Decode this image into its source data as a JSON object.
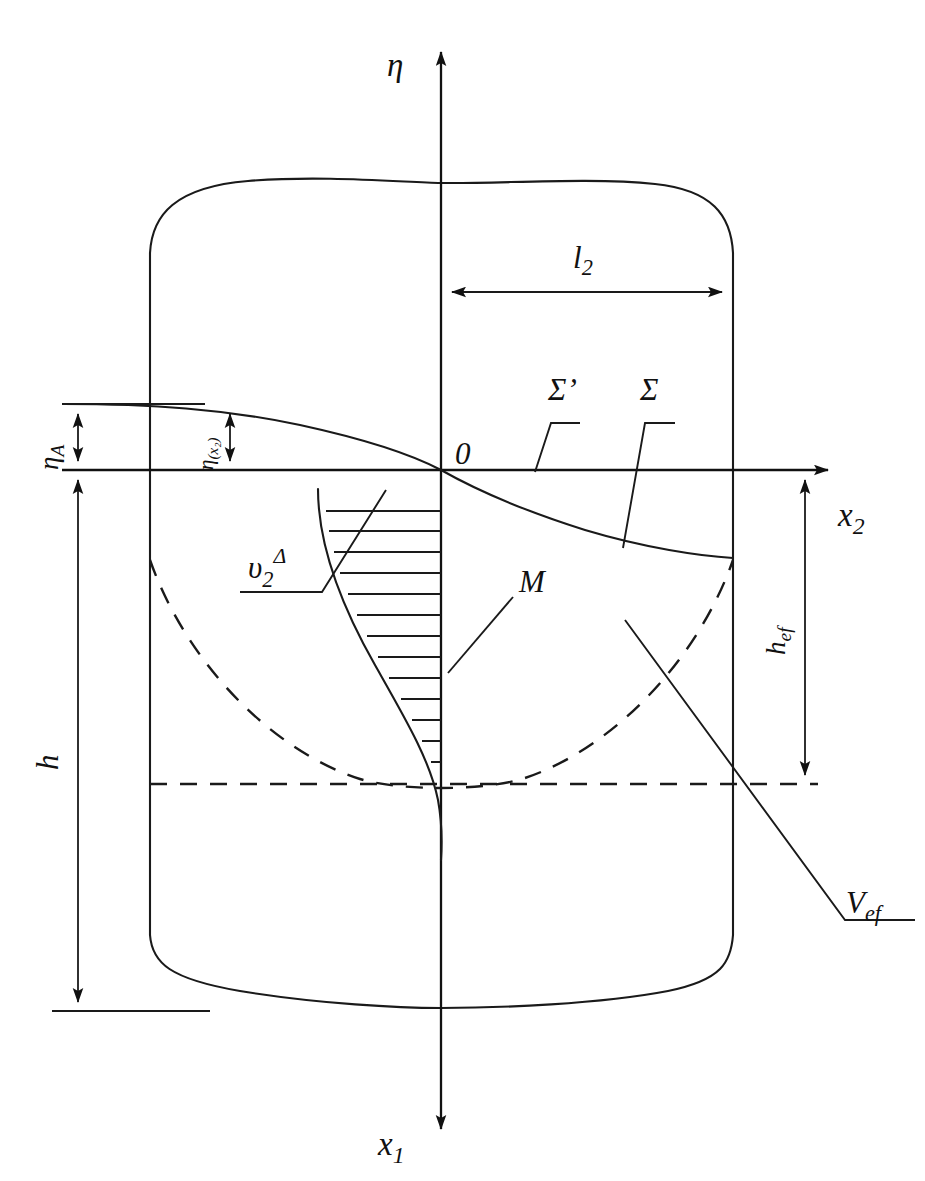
{
  "figure": {
    "kind": "engineering-diagram",
    "background_color": "#ffffff",
    "line_color": "#1a1a1a",
    "width": 925,
    "height": 1181
  },
  "axes": {
    "vertical_up": {
      "symbol": "η",
      "name": "eta-axis",
      "direction": "up",
      "label_side": "left"
    },
    "vertical_down": {
      "symbol": "x",
      "subscript": "1",
      "name": "x1-axis",
      "direction": "down",
      "label_side": "left"
    },
    "horizontal": {
      "symbol": "x",
      "subscript": "2",
      "name": "x2-axis",
      "direction": "right",
      "label_side": "right"
    },
    "origin": {
      "symbol": "0",
      "name": "origin-label"
    }
  },
  "dimensions": [
    {
      "id": "l2",
      "symbol": "l",
      "subscript": "2",
      "orientation": "horizontal",
      "double_headed": true,
      "description": "tank radius from axis to right wall"
    },
    {
      "id": "eta_A",
      "symbol": "η",
      "subscript": "A",
      "orientation": "vertical",
      "double_headed": true,
      "description": "free surface rise at wall above undisturbed level"
    },
    {
      "id": "eta_x2",
      "symbol": "η",
      "argument": "(x₂)",
      "orientation": "vertical",
      "double_headed": true,
      "description": "local free surface elevation function"
    },
    {
      "id": "h",
      "symbol": "h",
      "orientation": "vertical",
      "double_headed": true,
      "description": "total liquid depth"
    },
    {
      "id": "h_ef",
      "symbol": "h",
      "subscript": "ef",
      "orientation": "vertical",
      "double_headed": true,
      "description": "effective depth"
    }
  ],
  "annotations": [
    {
      "id": "sigma_prime",
      "symbol": "Σ",
      "prime": "’",
      "leader": "down-left to undisturbed free surface plane",
      "name": "sigma-prime-label"
    },
    {
      "id": "sigma",
      "symbol": "Σ",
      "leader": "down-left to deformed free surface curve",
      "name": "sigma-label"
    },
    {
      "id": "v2_delta",
      "symbol": "υ",
      "subscript": "2",
      "superscript": "Δ",
      "leader": "up-right to velocity profile boundary",
      "name": "v2-delta-label"
    },
    {
      "id": "M",
      "symbol": "M",
      "leader": "down-left to hatched velocity profile",
      "name": "m-label"
    },
    {
      "id": "V_ef",
      "symbol": "V",
      "subscript": "ef",
      "leader": "up-left into tank interior",
      "name": "v-ef-label"
    }
  ],
  "curves": [
    {
      "id": "free-surface",
      "style": "solid",
      "description": "S-shaped deformed free surface from left wall through origin to right wall"
    },
    {
      "id": "dashed-arc",
      "style": "dashed",
      "description": "parabolic arc marking effective depth boundary"
    },
    {
      "id": "dashed-baseline",
      "style": "dashed",
      "description": "horizontal dashed line at effective depth level"
    },
    {
      "id": "velocity-profile",
      "style": "hatched",
      "description": "hatched region between axis and velocity profile curve",
      "hatch_count": 13
    }
  ],
  "vessel": {
    "name": "cylindrical-tank",
    "top": "convex dome arc",
    "bottom": "convex bowl arc",
    "walls": "two vertical straight sides with rounded corners"
  }
}
